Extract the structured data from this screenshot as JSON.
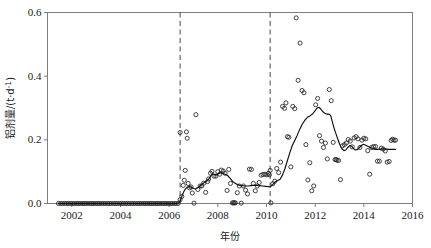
{
  "figure": {
    "background": "#ffffff",
    "plot_frame_color": "#7d7d7d",
    "data_color": "#222222",
    "line_color": "#101010",
    "dashed_color": "#4a4a4a"
  },
  "axes": {
    "x_title": "年份",
    "y_title_main": "铝剂量/(t·d",
    "y_title_sup": "-1",
    "y_title_tail": ")",
    "x_ticks": [
      "2002",
      "2004",
      "2006",
      "2008",
      "2010",
      "2012",
      "2014",
      "2016"
    ],
    "y_ticks": [
      "0.0",
      "0.2",
      "0.4",
      "0.6"
    ]
  },
  "chart_data": {
    "type": "scatter",
    "title": "",
    "xlabel": "年份",
    "ylabel": "铝剂量/(t·d-1)",
    "xlim": [
      2001.0,
      2016.0
    ],
    "ylim": [
      0.0,
      0.6
    ],
    "grid": false,
    "legend": null,
    "x_tick_values": [
      2002,
      2004,
      2006,
      2008,
      2010,
      2012,
      2014,
      2016
    ],
    "y_tick_values": [
      0.0,
      0.2,
      0.4,
      0.6
    ],
    "annotations": [
      {
        "type": "vline",
        "style": "dashed",
        "x": 2006.45,
        "label": ""
      },
      {
        "type": "vline",
        "style": "dashed",
        "x": 2010.15,
        "label": ""
      }
    ],
    "series": [
      {
        "name": "monthly-observations",
        "type": "scatter",
        "marker": "open-circle",
        "points": [
          [
            2001.45,
            0.0
          ],
          [
            2001.54,
            0.0
          ],
          [
            2001.62,
            0.0
          ],
          [
            2001.71,
            0.0
          ],
          [
            2001.79,
            0.0
          ],
          [
            2001.87,
            0.0
          ],
          [
            2001.96,
            0.0
          ],
          [
            2002.04,
            0.0
          ],
          [
            2002.12,
            0.0
          ],
          [
            2002.21,
            0.0
          ],
          [
            2002.29,
            0.0
          ],
          [
            2002.37,
            0.0
          ],
          [
            2002.46,
            0.0
          ],
          [
            2002.54,
            0.0
          ],
          [
            2002.62,
            0.0
          ],
          [
            2002.71,
            0.0
          ],
          [
            2002.79,
            0.0
          ],
          [
            2002.87,
            0.0
          ],
          [
            2002.96,
            0.0
          ],
          [
            2003.04,
            0.0
          ],
          [
            2003.12,
            0.0
          ],
          [
            2003.21,
            0.0
          ],
          [
            2003.29,
            0.0
          ],
          [
            2003.37,
            0.0
          ],
          [
            2003.46,
            0.0
          ],
          [
            2003.54,
            0.0
          ],
          [
            2003.62,
            0.0
          ],
          [
            2003.71,
            0.0
          ],
          [
            2003.79,
            0.0
          ],
          [
            2003.87,
            0.0
          ],
          [
            2003.96,
            0.0
          ],
          [
            2004.04,
            0.0
          ],
          [
            2004.12,
            0.0
          ],
          [
            2004.21,
            0.0
          ],
          [
            2004.29,
            0.0
          ],
          [
            2004.37,
            0.0
          ],
          [
            2004.46,
            0.0
          ],
          [
            2004.54,
            0.0
          ],
          [
            2004.62,
            0.0
          ],
          [
            2004.71,
            0.0
          ],
          [
            2004.79,
            0.0
          ],
          [
            2004.87,
            0.0
          ],
          [
            2004.96,
            0.0
          ],
          [
            2005.04,
            0.0
          ],
          [
            2005.12,
            0.0
          ],
          [
            2005.21,
            0.0
          ],
          [
            2005.29,
            0.0
          ],
          [
            2005.37,
            0.0
          ],
          [
            2005.46,
            0.0
          ],
          [
            2005.54,
            0.0
          ],
          [
            2005.62,
            0.0
          ],
          [
            2005.71,
            0.0
          ],
          [
            2005.79,
            0.0
          ],
          [
            2005.87,
            0.0
          ],
          [
            2005.96,
            0.0
          ],
          [
            2006.04,
            0.0
          ],
          [
            2006.12,
            0.0
          ],
          [
            2006.21,
            0.0
          ],
          [
            2006.29,
            0.0
          ],
          [
            2006.37,
            0.0
          ],
          [
            2006.45,
            0.223
          ],
          [
            2006.45,
            0.012
          ],
          [
            2006.52,
            0.022
          ],
          [
            2006.58,
            0.057
          ],
          [
            2006.62,
            0.073
          ],
          [
            2006.66,
            0.104
          ],
          [
            2006.71,
            0.225
          ],
          [
            2006.74,
            0.205
          ],
          [
            2006.78,
            0.063
          ],
          [
            2006.84,
            0.049
          ],
          [
            2006.9,
            0.052
          ],
          [
            2006.95,
            0.033
          ],
          [
            2007.02,
            0.001
          ],
          [
            2007.1,
            0.279
          ],
          [
            2007.18,
            0.044
          ],
          [
            2007.27,
            0.055
          ],
          [
            2007.34,
            0.055
          ],
          [
            2007.42,
            0.064
          ],
          [
            2007.5,
            0.035
          ],
          [
            2007.58,
            0.069
          ],
          [
            2007.62,
            0.077
          ],
          [
            2007.7,
            0.095
          ],
          [
            2007.76,
            0.101
          ],
          [
            2007.84,
            0.086
          ],
          [
            2007.92,
            0.086
          ],
          [
            2008.0,
            0.1
          ],
          [
            2008.08,
            0.092
          ],
          [
            2008.14,
            0.105
          ],
          [
            2008.22,
            0.102
          ],
          [
            2008.3,
            0.095
          ],
          [
            2008.38,
            0.041
          ],
          [
            2008.45,
            0.107
          ],
          [
            2008.52,
            0.063
          ],
          [
            2008.6,
            0.002
          ],
          [
            2008.64,
            0.002
          ],
          [
            2008.68,
            0.002
          ],
          [
            2008.72,
            0.002
          ],
          [
            2008.8,
            0.034
          ],
          [
            2008.88,
            0.055
          ],
          [
            2008.96,
            0.001
          ],
          [
            2009.05,
            0.055
          ],
          [
            2009.14,
            0.042
          ],
          [
            2009.22,
            0.03
          ],
          [
            2009.3,
            0.108
          ],
          [
            2009.38,
            0.107
          ],
          [
            2009.46,
            0.063
          ],
          [
            2009.54,
            0.04
          ],
          [
            2009.62,
            0.055
          ],
          [
            2009.7,
            0.066
          ],
          [
            2009.78,
            0.089
          ],
          [
            2009.86,
            0.091
          ],
          [
            2009.94,
            0.092
          ],
          [
            2010.02,
            0.09
          ],
          [
            2010.08,
            0.095
          ],
          [
            2010.12,
            0.09
          ],
          [
            2010.15,
            0.104
          ],
          [
            2010.18,
            0.002
          ],
          [
            2010.26,
            0.062
          ],
          [
            2010.34,
            0.07
          ],
          [
            2010.42,
            0.11
          ],
          [
            2010.5,
            0.097
          ],
          [
            2010.58,
            0.13
          ],
          [
            2010.66,
            0.305
          ],
          [
            2010.74,
            0.299
          ],
          [
            2010.8,
            0.316
          ],
          [
            2010.86,
            0.21
          ],
          [
            2010.92,
            0.208
          ],
          [
            2011.0,
            0.115
          ],
          [
            2011.08,
            0.305
          ],
          [
            2011.16,
            0.298
          ],
          [
            2011.22,
            0.583
          ],
          [
            2011.3,
            0.387
          ],
          [
            2011.38,
            0.504
          ],
          [
            2011.46,
            0.355
          ],
          [
            2011.54,
            0.348
          ],
          [
            2011.62,
            0.185
          ],
          [
            2011.7,
            0.074
          ],
          [
            2011.78,
            0.128
          ],
          [
            2011.86,
            0.04
          ],
          [
            2011.94,
            0.055
          ],
          [
            2012.02,
            0.31
          ],
          [
            2012.1,
            0.33
          ],
          [
            2012.18,
            0.213
          ],
          [
            2012.26,
            0.196
          ],
          [
            2012.34,
            0.176
          ],
          [
            2012.42,
            0.19
          ],
          [
            2012.5,
            0.14
          ],
          [
            2012.58,
            0.358
          ],
          [
            2012.66,
            0.323
          ],
          [
            2012.74,
            0.192
          ],
          [
            2012.82,
            0.138
          ],
          [
            2012.86,
            0.138
          ],
          [
            2012.9,
            0.136
          ],
          [
            2012.96,
            0.135
          ],
          [
            2013.04,
            0.075
          ],
          [
            2013.12,
            0.181
          ],
          [
            2013.2,
            0.185
          ],
          [
            2013.28,
            0.19
          ],
          [
            2013.36,
            0.201
          ],
          [
            2013.44,
            0.196
          ],
          [
            2013.52,
            0.178
          ],
          [
            2013.6,
            0.206
          ],
          [
            2013.68,
            0.21
          ],
          [
            2013.76,
            0.203
          ],
          [
            2013.84,
            0.176
          ],
          [
            2013.92,
            0.199
          ],
          [
            2014.0,
            0.205
          ],
          [
            2014.08,
            0.203
          ],
          [
            2014.16,
            0.166
          ],
          [
            2014.24,
            0.092
          ],
          [
            2014.32,
            0.176
          ],
          [
            2014.4,
            0.179
          ],
          [
            2014.48,
            0.179
          ],
          [
            2014.56,
            0.133
          ],
          [
            2014.64,
            0.133
          ],
          [
            2014.72,
            0.174
          ],
          [
            2014.8,
            0.171
          ],
          [
            2014.88,
            0.165
          ],
          [
            2014.96,
            0.13
          ],
          [
            2015.04,
            0.132
          ],
          [
            2015.12,
            0.198
          ],
          [
            2015.18,
            0.202
          ],
          [
            2015.24,
            0.199
          ],
          [
            2015.3,
            0.199
          ]
        ]
      },
      {
        "name": "moving-average-trend",
        "type": "line",
        "points": [
          [
            2001.45,
            0.0
          ],
          [
            2006.3,
            0.0
          ],
          [
            2006.42,
            0.003
          ],
          [
            2006.5,
            0.018
          ],
          [
            2006.58,
            0.034
          ],
          [
            2006.64,
            0.043
          ],
          [
            2006.72,
            0.05
          ],
          [
            2006.8,
            0.053
          ],
          [
            2006.9,
            0.052
          ],
          [
            2007.0,
            0.047
          ],
          [
            2007.1,
            0.046
          ],
          [
            2007.22,
            0.052
          ],
          [
            2007.34,
            0.06
          ],
          [
            2007.44,
            0.066
          ],
          [
            2007.54,
            0.07
          ],
          [
            2007.64,
            0.078
          ],
          [
            2007.72,
            0.088
          ],
          [
            2007.8,
            0.093
          ],
          [
            2007.88,
            0.09
          ],
          [
            2007.96,
            0.09
          ],
          [
            2008.04,
            0.094
          ],
          [
            2008.12,
            0.097
          ],
          [
            2008.2,
            0.094
          ],
          [
            2008.3,
            0.092
          ],
          [
            2008.4,
            0.088
          ],
          [
            2008.5,
            0.08
          ],
          [
            2008.6,
            0.07
          ],
          [
            2008.7,
            0.064
          ],
          [
            2008.8,
            0.06
          ],
          [
            2008.9,
            0.057
          ],
          [
            2009.0,
            0.056
          ],
          [
            2009.12,
            0.055
          ],
          [
            2009.24,
            0.055
          ],
          [
            2009.36,
            0.056
          ],
          [
            2009.48,
            0.057
          ],
          [
            2009.6,
            0.057
          ],
          [
            2009.72,
            0.056
          ],
          [
            2009.84,
            0.055
          ],
          [
            2009.96,
            0.054
          ],
          [
            2010.08,
            0.053
          ],
          [
            2010.16,
            0.052
          ],
          [
            2010.26,
            0.06
          ],
          [
            2010.36,
            0.068
          ],
          [
            2010.46,
            0.072
          ],
          [
            2010.56,
            0.076
          ],
          [
            2010.66,
            0.09
          ],
          [
            2010.76,
            0.11
          ],
          [
            2010.86,
            0.135
          ],
          [
            2010.96,
            0.16
          ],
          [
            2011.06,
            0.182
          ],
          [
            2011.16,
            0.198
          ],
          [
            2011.26,
            0.214
          ],
          [
            2011.36,
            0.232
          ],
          [
            2011.46,
            0.248
          ],
          [
            2011.58,
            0.262
          ],
          [
            2011.7,
            0.272
          ],
          [
            2011.8,
            0.276
          ],
          [
            2011.9,
            0.282
          ],
          [
            2012.0,
            0.292
          ],
          [
            2012.08,
            0.3
          ],
          [
            2012.16,
            0.302
          ],
          [
            2012.24,
            0.296
          ],
          [
            2012.32,
            0.288
          ],
          [
            2012.4,
            0.283
          ],
          [
            2012.48,
            0.281
          ],
          [
            2012.56,
            0.281
          ],
          [
            2012.64,
            0.276
          ],
          [
            2012.7,
            0.258
          ],
          [
            2012.78,
            0.236
          ],
          [
            2012.86,
            0.218
          ],
          [
            2012.94,
            0.2
          ],
          [
            2013.02,
            0.184
          ],
          [
            2013.1,
            0.172
          ],
          [
            2013.18,
            0.166
          ],
          [
            2013.26,
            0.168
          ],
          [
            2013.34,
            0.176
          ],
          [
            2013.42,
            0.182
          ],
          [
            2013.5,
            0.18
          ],
          [
            2013.58,
            0.172
          ],
          [
            2013.66,
            0.168
          ],
          [
            2013.74,
            0.17
          ],
          [
            2013.82,
            0.176
          ],
          [
            2013.9,
            0.182
          ],
          [
            2013.98,
            0.186
          ],
          [
            2014.06,
            0.184
          ],
          [
            2014.16,
            0.18
          ],
          [
            2014.26,
            0.176
          ],
          [
            2014.36,
            0.172
          ],
          [
            2014.46,
            0.17
          ],
          [
            2014.56,
            0.17
          ],
          [
            2014.68,
            0.171
          ],
          [
            2014.8,
            0.172
          ],
          [
            2014.92,
            0.171
          ],
          [
            2015.04,
            0.17
          ],
          [
            2015.16,
            0.17
          ],
          [
            2015.3,
            0.17
          ]
        ]
      }
    ]
  }
}
